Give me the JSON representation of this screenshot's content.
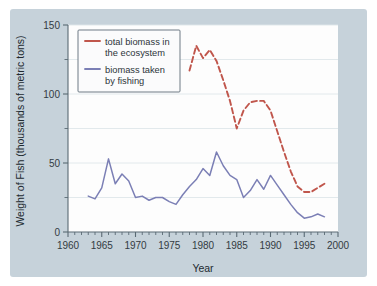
{
  "figure": {
    "background_color": "#c6d2da",
    "plot_background_color": "#fdfdfd"
  },
  "legend": {
    "position": "top-left-inside",
    "entries": [
      {
        "label_line1": "total biomass in",
        "label_line2": "the ecosystem",
        "color": "#c0564c",
        "dash": "dashed"
      },
      {
        "label_line1": "biomass taken",
        "label_line2": "by fishing",
        "color": "#7b7fb5",
        "dash": "solid"
      }
    ]
  },
  "chart_data": {
    "type": "line",
    "title": "",
    "xlabel": "Year",
    "ylabel": "Weight of Fish (thousands of metric tons)",
    "xlim": [
      1960,
      2000
    ],
    "ylim": [
      0,
      150
    ],
    "xticks": [
      1960,
      1965,
      1970,
      1975,
      1980,
      1985,
      1990,
      1995,
      2000
    ],
    "xtick_labels": [
      "1960",
      "1965",
      "1970",
      "1975",
      "1980",
      "1985",
      "1990",
      "1995",
      "2000"
    ],
    "x_minor_tick_step": 1,
    "yticks": [
      0,
      50,
      100,
      150
    ],
    "ytick_labels": [
      "0",
      "50",
      "100",
      "150"
    ],
    "y_minor_ticks": [
      25,
      75,
      125
    ],
    "grid": "horizontal",
    "series": [
      {
        "name": "total biomass in the ecosystem",
        "color": "#c0564c",
        "dash": "dashed",
        "x": [
          1978,
          1979,
          1980,
          1981,
          1982,
          1983,
          1984,
          1985,
          1986,
          1987,
          1988,
          1989,
          1990,
          1991,
          1992,
          1993,
          1994,
          1995,
          1996,
          1997,
          1998
        ],
        "values": [
          117,
          135,
          126,
          132,
          124,
          110,
          95,
          75,
          88,
          94,
          95,
          95,
          88,
          73,
          58,
          44,
          33,
          29,
          29,
          32,
          35
        ]
      },
      {
        "name": "biomass taken by fishing",
        "color": "#7b7fb5",
        "dash": "solid",
        "x": [
          1963,
          1964,
          1965,
          1966,
          1967,
          1968,
          1969,
          1970,
          1971,
          1972,
          1973,
          1974,
          1975,
          1976,
          1977,
          1978,
          1979,
          1980,
          1981,
          1982,
          1983,
          1984,
          1985,
          1986,
          1987,
          1988,
          1989,
          1990,
          1991,
          1992,
          1993,
          1994,
          1995,
          1996,
          1997,
          1998
        ],
        "values": [
          26,
          24,
          32,
          53,
          35,
          42,
          37,
          25,
          26,
          23,
          25,
          25,
          22,
          20,
          27,
          33,
          38,
          46,
          41,
          58,
          48,
          41,
          38,
          25,
          30,
          38,
          31,
          41,
          34,
          27,
          20,
          14,
          10,
          11,
          13,
          11
        ]
      }
    ]
  }
}
